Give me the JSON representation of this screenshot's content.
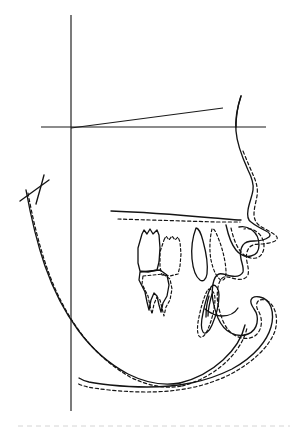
{
  "figure": {
    "kind": "cephalometric-lateral-tracing-superimposition",
    "title": "Lateral cephalometric tracing superimposition",
    "width": 304,
    "height": 429,
    "background_color": "#ffffff",
    "ink_color": "#141414",
    "legend": {
      "solid_meaning": "pre-treatment tracing",
      "dashed_meaning": "post-treatment tracing"
    }
  },
  "reference_lines": {
    "vertical_registration_line": {
      "label": "vertical registration line",
      "x1": 71,
      "y1": 15,
      "x2": 71,
      "y2": 411
    },
    "horizontal_reference_line": {
      "label": "horizontal reference line",
      "x1": 41,
      "y1": 127,
      "x2": 266,
      "y2": 127
    },
    "sella_nasion_line": {
      "label": "sella-nasion line",
      "x1": 71,
      "y1": 128,
      "x2": 223,
      "y2": 108
    },
    "palatal_plane_line": {
      "label": "palatal plane",
      "x1": 111,
      "y1": 211,
      "x2": 241,
      "y2": 220
    },
    "palatal_plane_line_dashed": {
      "label": "palatal plane post-treatment",
      "x1": 118,
      "y1": 219,
      "x2": 240,
      "y2": 222
    },
    "condyle_marker": {
      "label": "condyle marker",
      "x1": 20,
      "y1": 201,
      "x2": 49,
      "y2": 180
    },
    "bottom_artifact": {
      "label": "scan edge artifact",
      "x1": 18,
      "y1": 426,
      "x2": 290,
      "y2": 426
    }
  },
  "outlines": {
    "soft_tissue_profile_solid": {
      "name": "soft tissue profile (pre-treatment)",
      "d": "M 241 96 C 237 108 235 120 236 131 C 237 145 243 159 248 170 C 252 178 254 184 253 190 C 252 197 249 203 248 210 C 247 216 248 220 251 222 C 256 226 262 229 266 231 C 270 233 271 235 269 237 C 265 240 259 241 254 241 C 249 241 245 242 243 245 C 240 249 240 254 241 259 C 242 264 244 268 243 272 C 241 276 236 277 231 276 C 226 275 222 273 219 274 C 216 275 214 279 213 284 C 212 290 212 296 213 301 C 214 307 216 313 218 318 C 221 325 225 330 231 333 C 237 336 243 336 248 334 C 253 332 256 328 257 323 C 258 318 257 313 254 309 C 252 306 250 303 251 300 C 252 297 256 296 260 297 C 265 298 269 302 271 307 C 273 313 273 320 271 327 C 269 334 265 341 259 348 C 252 356 243 363 232 369 C 220 375 206 380 191 383 C 176 386 161 387 147 387 C 133 387 120 386 110 385 C 101 384 94 383 89 382 C 85 381 82 380 79 378"
    },
    "soft_tissue_profile_dashed": {
      "name": "soft tissue profile (post-treatment)",
      "d": "M 243 151 C 247 161 251 170 254 177 C 257 184 258 190 257 196 C 256 202 254 208 254 214 C 254 219 256 223 260 226 C 265 229 271 232 275 235 C 278 237 278 239 275 241 C 271 243 265 244 260 244 C 255 244 251 245 249 248 C 246 252 246 257 247 262 C 248 267 249 271 248 275 C 246 279 241 280 236 279 C 231 278 227 276 224 277 C 221 278 219 282 218 287 C 217 293 217 299 218 304 C 219 310 221 316 223 321 C 226 328 230 333 236 336 C 242 339 248 339 253 337 C 257 335 260 331 261 326 C 262 321 261 316 259 312 C 257 309 256 306 257 303 C 258 300 261 299 265 300 C 269 301 273 305 275 311 C 277 317 277 324 275 331 C 272 339 267 346 260 353 C 252 361 242 368 231 374 C 219 380 205 385 190 388 C 175 391 160 392 146 392 C 132 392 119 391 109 390 C 100 389 93 388 88 387 C 84 386 80 385 77 383"
    },
    "cranial_base_solid": {
      "name": "cranial base / frontal outline",
      "d": "M 241 96 C 238 105 236 116 236 127"
    },
    "mandible_body_solid": {
      "name": "mandibular lower border (pre-treatment)",
      "d": "M 26 190 C 30 212 36 240 45 266 C 53 289 64 311 78 330 C 92 349 109 364 128 374 C 146 383 164 386 180 383"
    },
    "mandible_body_dashed": {
      "name": "mandibular lower border (post-treatment)",
      "d": "M 28 193 C 32 215 38 242 47 268 C 55 291 66 313 80 332 C 94 351 111 366 130 377 C 148 386 166 389 182 386"
    },
    "ramus_anterior_solid": {
      "name": "anterior ramus border",
      "d": "M 44 175 C 42 183 39 193 36 204"
    },
    "mandible_inner_solid": {
      "name": "mandibular symphysis inner contour (pre-treatment)",
      "d": "M 180 383 C 196 379 211 371 223 360 C 234 350 242 338 245 325"
    },
    "mandible_inner_dashed": {
      "name": "mandibular symphysis inner contour (post-treatment)",
      "d": "M 182 386 C 198 382 213 374 225 363 C 236 353 244 341 247 328"
    },
    "maxilla_anterior_solid": {
      "name": "maxillary anterior contour",
      "d": "M 111 211 C 140 212 180 215 214 218 C 226 219 235 220 241 220"
    },
    "maxilla_anterior_dashed": {
      "name": "maxillary anterior contour post-treatment",
      "d": "M 118 219 C 148 220 186 221 216 222 C 228 222 236 222 240 222"
    },
    "upper_lip_solid": {
      "name": "upper lip / alveolus contour",
      "d": "M 226 225 C 228 234 231 244 236 250 C 240 255 246 257 251 256 C 256 255 259 251 259 245 C 259 239 256 233 252 230 C 248 227 243 226 239 227"
    },
    "upper_lip_dashed": {
      "name": "upper lip / alveolus contour post-treatment",
      "d": "M 231 228 C 233 237 236 246 241 252 C 245 257 251 259 256 258 C 261 257 264 252 264 246 C 264 240 261 235 257 232 C 253 229 248 228 244 229"
    },
    "chin_notch_solid": {
      "name": "antegonial notch contour",
      "d": "M 205 309 C 210 313 216 316 222 316 C 229 316 235 313 238 308"
    }
  },
  "teeth": {
    "upper_molar_solid": {
      "name": "upper first molar (pre-treatment)",
      "d": "M 142 234 L 144 230 L 147 234 L 150 229 L 153 234 L 157 230 L 159 235 L 160 248 L 159 262 L 157 270 L 148 272 L 140 271 L 138 263 L 138 248 Z"
    },
    "upper_molar_dashed": {
      "name": "upper first molar (post-treatment)",
      "d": "M 164 240 L 166 236 L 169 240 L 172 236 L 175 240 L 178 237 L 180 242 L 181 254 L 180 266 L 178 274 L 170 276 L 162 275 L 160 267 L 160 252 Z"
    },
    "lower_molar_solid": {
      "name": "lower first molar (pre-treatment)",
      "d": "M 140 272 L 160 270 L 167 275 L 169 285 L 167 296 L 163 303 L 161 312 L 159 305 L 157 296 L 154 293 L 151 300 L 149 310 L 147 302 L 145 292 L 142 286 L 139 280 Z"
    },
    "lower_molar_dashed": {
      "name": "lower first molar (post-treatment)",
      "d": "M 143 276 L 163 274 L 170 279 L 172 289 L 170 300 L 166 307 L 164 316 L 162 308 L 160 300 L 157 297 L 154 304 L 152 314 L 150 306 L 148 296 L 145 290 L 142 284 Z"
    },
    "upper_incisor_solid": {
      "name": "upper central incisor (pre-treatment)",
      "d": "M 196 228 C 193 236 191 248 192 259 C 193 269 196 277 200 280 C 203 282 206 280 207 274 C 208 266 206 252 203 241 C 201 233 198 228 196 228 Z"
    },
    "upper_incisor_dashed": {
      "name": "upper central incisor (post-treatment)",
      "d": "M 212 229 C 210 237 209 249 211 260 C 213 270 217 278 221 280 C 224 281 226 278 226 272 C 226 264 223 250 219 240 C 216 232 214 228 212 229 Z"
    },
    "lower_incisor_solid": {
      "name": "lower central incisor (pre-treatment)",
      "d": "M 211 287 C 208 293 205 303 203 313 C 201 322 201 329 203 332 C 205 335 209 332 212 325 C 216 316 219 303 219 295 C 219 289 216 285 213 285 Z"
    },
    "lower_incisor_dashed": {
      "name": "lower central incisor (post-treatment)",
      "d": "M 207 291 C 204 297 201 307 199 317 C 197 326 197 333 199 336 C 201 339 205 336 208 329 C 212 320 215 307 215 299 C 215 293 212 289 209 289 Z"
    },
    "lower_incisor_shading": {
      "name": "lower incisor root shading",
      "d": "M 209 296 C 207 302 206 310 206 317 M 212 294 C 210 301 208 309 208 316"
    }
  }
}
